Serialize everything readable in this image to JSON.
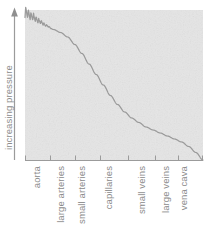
{
  "figure": {
    "name": "blood-pressure-across-vasculature",
    "background_color": "#ffffff",
    "plot_background_color": "#e5e5e5",
    "curve_color": "#9a9a9a",
    "axis_color": "#9b9b9b",
    "label_color": "#8c8c8c"
  },
  "yaxis": {
    "label": "increasing pressure",
    "arrow_icon": "up-arrow-icon",
    "ticks": [],
    "direction": "up"
  },
  "xaxis": {
    "label": "",
    "categories": [
      "aorta",
      "large arteries",
      "small arteries",
      "capillaries",
      "small veins",
      "large veins",
      "vena cava"
    ]
  },
  "chart_data": {
    "type": "line",
    "title": "",
    "subtitle": "",
    "xlabel": "",
    "ylabel": "increasing pressure",
    "grid": false,
    "legend": null,
    "legend_position": "none",
    "xlim": [
      0,
      1
    ],
    "ylim": [
      0,
      1
    ],
    "axis_tick_labels_x": [
      "aorta",
      "large arteries",
      "small arteries",
      "capillaries",
      "small veins",
      "large veins",
      "vena cava"
    ],
    "axis_tick_labels_y": [],
    "annotations": [
      "pulsatile oscillation in aorta and large arteries",
      "steep pressure drop across arterioles and capillaries",
      "low gradual decline through venous system to vena cava"
    ],
    "categories": [
      "aorta",
      "large arteries",
      "small arteries",
      "capillaries",
      "small veins",
      "large veins",
      "vena cava"
    ],
    "series": [
      {
        "name": "mean pressure",
        "x": [
          0.0,
          0.04,
          0.08,
          0.12,
          0.16,
          0.2,
          0.24,
          0.28,
          0.32,
          0.36,
          0.4,
          0.44,
          0.48,
          0.52,
          0.56,
          0.6,
          0.64,
          0.68,
          0.72,
          0.76,
          0.8,
          0.84,
          0.88,
          0.92,
          0.96,
          1.0
        ],
        "values": [
          0.95,
          0.93,
          0.91,
          0.89,
          0.87,
          0.85,
          0.82,
          0.77,
          0.71,
          0.64,
          0.57,
          0.5,
          0.43,
          0.37,
          0.32,
          0.28,
          0.25,
          0.22,
          0.2,
          0.18,
          0.16,
          0.14,
          0.12,
          0.09,
          0.05,
          0.0
        ]
      },
      {
        "name": "pulse oscillation envelope",
        "x": [
          0.0,
          0.02,
          0.04,
          0.06,
          0.08,
          0.1,
          0.12,
          0.14,
          0.16
        ],
        "systolic": [
          1.0,
          0.99,
          0.98,
          0.97,
          0.95,
          0.94,
          0.92,
          0.9,
          0.88
        ],
        "diastolic": [
          0.88,
          0.87,
          0.86,
          0.86,
          0.85,
          0.85,
          0.85,
          0.86,
          0.87
        ],
        "peak_count": 11
      }
    ]
  }
}
